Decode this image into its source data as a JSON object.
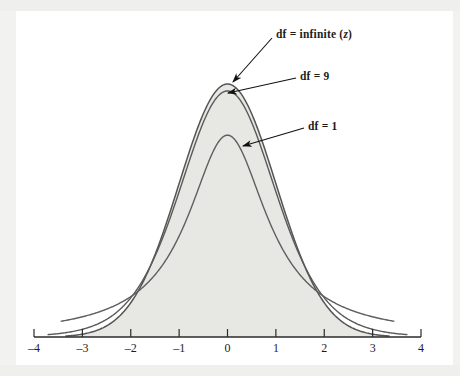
{
  "figure": {
    "background_color": "#f2f2f0",
    "plate_color": "#ffffff",
    "fill_color": "#e7e7e4",
    "line_color": "#555555",
    "axis_color": "#2b2b2b",
    "text_color": "#1d1d1d"
  },
  "annotations": [
    {
      "id": "df-infinite",
      "text_prefix": "df = infinite (",
      "text_italic": "z",
      "text_suffix": ")",
      "full_text": "df = infinite (z)",
      "label_x": 276,
      "label_y": 28,
      "arrow_from_x": 272,
      "arrow_from_y": 38,
      "arrow_to_x": 233,
      "arrow_to_y": 82
    },
    {
      "id": "df-9",
      "full_text": "df = 9",
      "label_x": 300,
      "label_y": 70,
      "arrow_from_x": 296,
      "arrow_from_y": 78,
      "arrow_to_x": 228,
      "arrow_to_y": 93
    },
    {
      "id": "df-1",
      "full_text": "df = 1",
      "label_x": 308,
      "label_y": 120,
      "arrow_from_x": 304,
      "arrow_from_y": 128,
      "arrow_to_x": 243,
      "arrow_to_y": 146
    }
  ],
  "axis": {
    "ticks": [
      {
        "value": -4,
        "label": "–4"
      },
      {
        "value": -3,
        "label": "–3"
      },
      {
        "value": -2,
        "label": "–2"
      },
      {
        "value": -1,
        "label": "–1"
      },
      {
        "value": 0,
        "label": "0"
      },
      {
        "value": 1,
        "label": "1"
      },
      {
        "value": 2,
        "label": "2"
      },
      {
        "value": 3,
        "label": "3"
      },
      {
        "value": 4,
        "label": "4"
      }
    ],
    "x_min": -4,
    "x_max": 4,
    "pixel_left": 34,
    "pixel_right": 421,
    "baseline_y": 337,
    "tick_height": 8,
    "label_y": 341
  },
  "chart_data": {
    "type": "line",
    "title": "",
    "xlabel": "",
    "ylabel": "",
    "xlim": [
      -4,
      4
    ],
    "ylim": [
      0,
      0.42
    ],
    "grid": false,
    "legend_position": "annotations-inline",
    "x": [
      -4,
      -3.5,
      -3,
      -2.5,
      -2,
      -1.5,
      -1,
      -0.5,
      0,
      0.5,
      1,
      1.5,
      2,
      2.5,
      3,
      3.5,
      4
    ],
    "series": [
      {
        "name": "df = infinite (z)",
        "label": "df = infinite (z)",
        "peak_value": 0.399,
        "values": [
          0.0001,
          0.0009,
          0.0044,
          0.0175,
          0.054,
          0.1295,
          0.242,
          0.3521,
          0.3989,
          0.3521,
          0.242,
          0.1295,
          0.054,
          0.0175,
          0.0044,
          0.0009,
          0.0001
        ]
      },
      {
        "name": "df = 9",
        "label": "df = 9",
        "peak_value": 0.388,
        "values": [
          0.0024,
          0.005,
          0.0102,
          0.0203,
          0.0488,
          0.1147,
          0.2268,
          0.3418,
          0.388,
          0.3418,
          0.2268,
          0.1147,
          0.0488,
          0.0203,
          0.0102,
          0.005,
          0.0024
        ]
      },
      {
        "name": "df = 1",
        "label": "df = 1",
        "peak_value": 0.318,
        "values": [
          0.0187,
          0.024,
          0.0318,
          0.0439,
          0.0637,
          0.0979,
          0.1592,
          0.2546,
          0.3183,
          0.2546,
          0.1592,
          0.0979,
          0.0637,
          0.0439,
          0.0318,
          0.024,
          0.0187
        ]
      }
    ]
  }
}
